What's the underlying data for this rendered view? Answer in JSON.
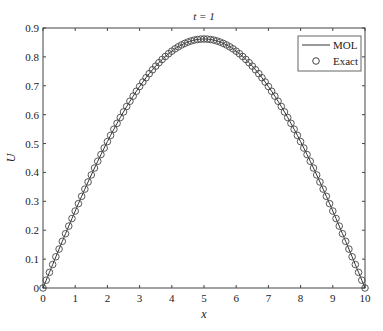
{
  "chart_data": {
    "type": "line",
    "title": "t = 1",
    "xlabel": "x",
    "ylabel": "U",
    "xlim": [
      0,
      10
    ],
    "ylim": [
      0,
      0.9
    ],
    "xticks": [
      0,
      1,
      2,
      3,
      4,
      5,
      6,
      7,
      8,
      9,
      10
    ],
    "yticks": [
      0,
      0.1,
      0.2,
      0.3,
      0.4,
      0.5,
      0.6,
      0.7,
      0.8,
      0.9
    ],
    "grid": false,
    "legend_position": "upper right",
    "series": [
      {
        "name": "MOL",
        "style": "solid line",
        "formula": "0.862*sin(pi*x/10)",
        "peak": 0.862
      },
      {
        "name": "Exact",
        "style": "circle markers",
        "x_step": 0.1,
        "formula": "0.862*sin(pi*x/10)"
      }
    ],
    "sample_points": {
      "x": [
        0,
        1,
        2,
        3,
        4,
        5,
        6,
        7,
        8,
        9,
        10
      ],
      "y": [
        0,
        0.266,
        0.507,
        0.697,
        0.82,
        0.862,
        0.82,
        0.697,
        0.507,
        0.266,
        0
      ]
    }
  },
  "legend": {
    "items": [
      "MOL",
      "Exact"
    ]
  }
}
